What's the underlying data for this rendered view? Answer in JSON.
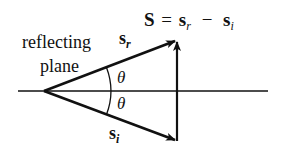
{
  "diagram": {
    "labels": {
      "plane_line1": "reflecting",
      "plane_line2": "plane",
      "reflected_vector": "s",
      "reflected_sub": "r",
      "incident_vector": "s",
      "incident_sub": "i",
      "angle_upper": "θ",
      "angle_lower": "θ"
    },
    "equation": {
      "lhs": "S",
      "equals": "=",
      "term1": "s",
      "term1_sub": "r",
      "minus": "−",
      "term2": "s",
      "term2_sub": "i"
    },
    "colors": {
      "ink": "#111111",
      "background": "#ffffff"
    }
  }
}
